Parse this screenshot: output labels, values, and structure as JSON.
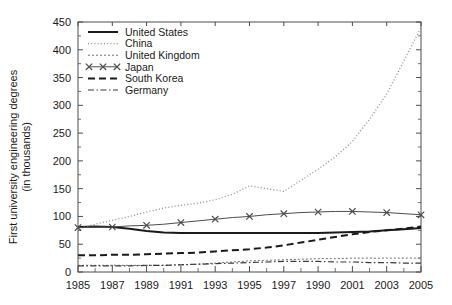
{
  "chart_data": {
    "type": "line",
    "title": "",
    "xlabel": "",
    "ylabel": "First university engineering degrees",
    "ylabel_line2": "(in thousands)",
    "xlim": [
      1985,
      2005
    ],
    "ylim": [
      0,
      450
    ],
    "grid": false,
    "legend_position": "top-left",
    "x_tick_labels": [
      "1985",
      "1987",
      "1989",
      "1991",
      "1993",
      "1995",
      "1997",
      "1990",
      "2001",
      "2003",
      "2005"
    ],
    "x_tick_values": [
      1985,
      1987,
      1989,
      1991,
      1993,
      1995,
      1997,
      1999,
      2001,
      2003,
      2005
    ],
    "y_tick_labels": [
      "0",
      "50",
      "100",
      "150",
      "200",
      "250",
      "300",
      "350",
      "400",
      "450"
    ],
    "y_tick_values": [
      0,
      50,
      100,
      150,
      200,
      250,
      300,
      350,
      400,
      450
    ],
    "x": [
      1985,
      1986,
      1987,
      1988,
      1989,
      1990,
      1991,
      1992,
      1993,
      1994,
      1995,
      1996,
      1997,
      1998,
      1999,
      2000,
      2001,
      2002,
      2003,
      2004,
      2005
    ],
    "series": [
      {
        "name": "United States",
        "style": "solid",
        "color": "#1a1a1a",
        "values": [
          81,
          82,
          81,
          78,
          74,
          71,
          70,
          70,
          70,
          70,
          70,
          70,
          70,
          70,
          70,
          71,
          72,
          73,
          75,
          77,
          79
        ]
      },
      {
        "name": "China",
        "style": "dotted",
        "color": "#8c8c8c",
        "values": [
          78,
          86,
          93,
          100,
          108,
          115,
          120,
          124,
          130,
          140,
          155,
          150,
          145,
          165,
          185,
          207,
          235,
          275,
          320,
          380,
          440
        ]
      },
      {
        "name": "United Kingdom",
        "style": "fine-dashed",
        "color": "#6e6e6e",
        "values": [
          12,
          12,
          12,
          12,
          12,
          12,
          13,
          14,
          16,
          18,
          20,
          21,
          22,
          23,
          24,
          24,
          25,
          25,
          25,
          25,
          25
        ]
      },
      {
        "name": "Japan",
        "style": "marker-x",
        "color": "#4d4d4d",
        "values": [
          80,
          81,
          81,
          83,
          84,
          86,
          89,
          92,
          95,
          98,
          100,
          103,
          105,
          107,
          108,
          109,
          109,
          108,
          107,
          105,
          103
        ]
      },
      {
        "name": "South Korea",
        "style": "dashed",
        "color": "#1a1a1a",
        "values": [
          30,
          30,
          31,
          31,
          32,
          33,
          34,
          35,
          37,
          39,
          41,
          44,
          48,
          53,
          58,
          63,
          68,
          72,
          75,
          78,
          82
        ]
      },
      {
        "name": "Germany",
        "style": "dash-dot",
        "color": "#3a3a3a",
        "values": [
          11,
          11,
          11,
          11,
          12,
          12,
          13,
          14,
          15,
          16,
          17,
          18,
          19,
          19,
          19,
          18,
          18,
          17,
          17,
          16,
          16
        ]
      }
    ]
  },
  "legend": {
    "items": [
      {
        "label": "United States"
      },
      {
        "label": "China"
      },
      {
        "label": "United Kingdom"
      },
      {
        "label": "Japan"
      },
      {
        "label": "South Korea"
      },
      {
        "label": "Germany"
      }
    ]
  }
}
